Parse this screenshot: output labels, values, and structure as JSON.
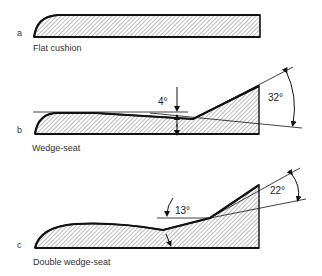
{
  "figures": [
    {
      "letter": "a",
      "caption": "Flat cushion"
    },
    {
      "letter": "b",
      "caption": "Wedge-seat",
      "angles": [
        "4°",
        "32°"
      ]
    },
    {
      "letter": "c",
      "caption": "Double wedge-seat",
      "angles": [
        "13°",
        "22°"
      ]
    }
  ],
  "colors": {
    "outline": "#111111",
    "hatch": "#555555",
    "background": "#ffffff"
  }
}
